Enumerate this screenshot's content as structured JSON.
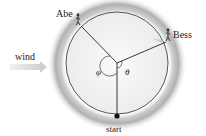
{
  "diagram": {
    "labels": {
      "abe": "Abe",
      "bess": "Bess",
      "wind": "wind",
      "start": "start",
      "angle_phi": "φ",
      "angle_theta": "θ"
    },
    "colors": {
      "track_shadow": "#9a9a9a",
      "circle": "#444444",
      "radius_lines": "#222222",
      "wind_arrow": "#d8d8d8"
    }
  }
}
